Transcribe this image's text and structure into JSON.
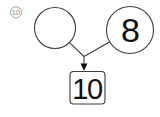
{
  "item_marker": {
    "value": "10"
  },
  "number_bond": {
    "left_addend": "",
    "right_addend": "8",
    "sum": "10"
  },
  "colors": {
    "stroke": "#3d3d3d",
    "text": "#111111",
    "marker": "#888888",
    "background": "#ffffff"
  }
}
